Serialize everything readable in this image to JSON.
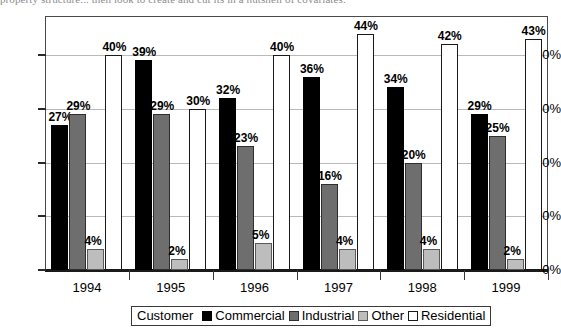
{
  "document_text_top": "property structure...  then look to create and cut its in a nutshell of covariates.",
  "chart_data": {
    "type": "bar",
    "title": "",
    "xlabel": "",
    "ylabel": "",
    "categories": [
      "1994",
      "1995",
      "1996",
      "1997",
      "1998",
      "1999"
    ],
    "series": [
      {
        "name": "Commercial",
        "color": "#000000",
        "values": [
          27,
          39,
          32,
          36,
          34,
          29
        ],
        "labels": [
          "27%",
          "39%",
          "32%",
          "36%",
          "34%",
          "29%"
        ]
      },
      {
        "name": "Industrial",
        "color": "#6e6e6e",
        "values": [
          29,
          29,
          23,
          16,
          20,
          25
        ],
        "labels": [
          "29%",
          "29%",
          "23%",
          "16%",
          "20%",
          "25%"
        ]
      },
      {
        "name": "Other",
        "color": "#bdbdbd",
        "values": [
          4,
          2,
          5,
          4,
          4,
          2
        ],
        "labels": [
          "4%",
          "2%",
          "5%",
          "4%",
          "4%",
          "2%"
        ]
      },
      {
        "name": "Residential",
        "color": "#ffffff",
        "values": [
          40,
          30,
          40,
          44,
          42,
          43
        ],
        "labels": [
          "40%",
          "30%",
          "40%",
          "44%",
          "42%",
          "43%"
        ]
      }
    ],
    "ylim": [
      0,
      47
    ],
    "yticks": [
      0,
      10,
      20,
      30,
      40
    ],
    "ytick_labels": [
      "0%",
      "10%",
      "20%",
      "30%",
      "40%"
    ],
    "grid": true,
    "legend_position": "bottom",
    "legend_title": "Customer"
  },
  "legend": {
    "title": "Customer",
    "entries": [
      {
        "label": "Commercial",
        "swatch": "commercial"
      },
      {
        "label": "Industrial",
        "swatch": "industrial"
      },
      {
        "label": "Other",
        "swatch": "other"
      },
      {
        "label": "Residential",
        "swatch": "residential"
      }
    ]
  }
}
